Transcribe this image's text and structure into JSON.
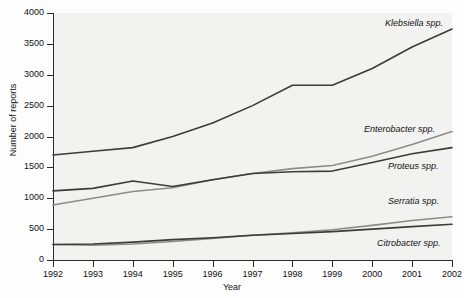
{
  "chart_data": {
    "type": "line",
    "title": "",
    "xlabel": "Year",
    "ylabel": "Number of reports",
    "x": [
      1992,
      1993,
      1994,
      1995,
      1996,
      1997,
      1998,
      1999,
      2000,
      2001,
      2002
    ],
    "xtick_labels": [
      "1992",
      "1993",
      "1994",
      "1995",
      "1996",
      "1997",
      "1998",
      "1999",
      "2000",
      "2001",
      "2002"
    ],
    "ytick_labels": [
      "0",
      "500",
      "1000",
      "1500",
      "2000",
      "2500",
      "3000",
      "3500",
      "4000"
    ],
    "yticks": [
      0,
      500,
      1000,
      1500,
      2000,
      2500,
      3000,
      3500,
      4000
    ],
    "ylim": [
      0,
      4000
    ],
    "xlim": [
      1992,
      2002
    ],
    "grid": false,
    "legend_position": "inline-right-of-line-ends",
    "series": [
      {
        "name": "Klebsiella spp.",
        "color": "#3b3b3b",
        "label_x": 385,
        "label_y": 18,
        "values": [
          1700,
          1760,
          1820,
          2000,
          2220,
          2500,
          2830,
          2830,
          3100,
          3450,
          3740
        ]
      },
      {
        "name": "Enterobacter spp.",
        "color": "#8c8c8c",
        "label_x": 364,
        "label_y": 124,
        "values": [
          890,
          1000,
          1110,
          1170,
          1300,
          1400,
          1480,
          1530,
          1680,
          1870,
          2080
        ]
      },
      {
        "name": "Proteus spp.",
        "color": "#3b3b3b",
        "label_x": 388,
        "label_y": 161,
        "values": [
          1120,
          1160,
          1280,
          1190,
          1300,
          1400,
          1430,
          1440,
          1580,
          1720,
          1820
        ]
      },
      {
        "name": "Serratia spp.",
        "color": "#8c8c8c",
        "label_x": 388,
        "label_y": 196,
        "values": [
          250,
          240,
          260,
          300,
          350,
          400,
          440,
          490,
          560,
          640,
          700
        ]
      },
      {
        "name": "Citrobacter spp.",
        "color": "#3b3b3b",
        "label_x": 377,
        "label_y": 238,
        "values": [
          250,
          260,
          290,
          330,
          360,
          400,
          430,
          460,
          500,
          540,
          580
        ]
      }
    ]
  }
}
